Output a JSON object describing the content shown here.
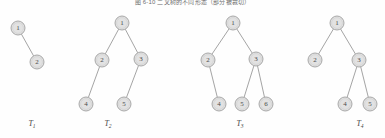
{
  "figure": {
    "caption": "图 6-10    二叉树的不同形态（部分被裁切）",
    "background_color": "#fefefe",
    "node_fill": "#e2e2e2",
    "node_stroke": "#a0a0a0",
    "edge_color": "#9a9a9a",
    "label_color": "#4a4a4a"
  },
  "trees": [
    {
      "name": "T1",
      "label": "T",
      "label_sub": "1",
      "label_x": 32,
      "label_y": 126,
      "nodes": [
        {
          "id": "t1n1",
          "value": "1",
          "x": 18,
          "y": 28,
          "r": 7
        },
        {
          "id": "t1n2",
          "value": "2",
          "x": 37,
          "y": 62,
          "r": 7
        }
      ],
      "edges": [
        {
          "from": "t1n1",
          "to": "t1n2"
        }
      ]
    },
    {
      "name": "T2",
      "label": "T",
      "label_sub": "2",
      "label_x": 108,
      "label_y": 126,
      "nodes": [
        {
          "id": "t2n1",
          "value": "1",
          "x": 122,
          "y": 23,
          "r": 7
        },
        {
          "id": "t2n2",
          "value": "2",
          "x": 102,
          "y": 60,
          "r": 7
        },
        {
          "id": "t2n3",
          "value": "3",
          "x": 141,
          "y": 59,
          "r": 7
        },
        {
          "id": "t2n4",
          "value": "4",
          "x": 86,
          "y": 104,
          "r": 7
        },
        {
          "id": "t2n5",
          "value": "5",
          "x": 124,
          "y": 104,
          "r": 7
        }
      ],
      "edges": [
        {
          "from": "t2n1",
          "to": "t2n2"
        },
        {
          "from": "t2n1",
          "to": "t2n3"
        },
        {
          "from": "t2n2",
          "to": "t2n4"
        },
        {
          "from": "t2n3",
          "to": "t2n5"
        }
      ]
    },
    {
      "name": "T3",
      "label": "T",
      "label_sub": "3",
      "label_x": 240,
      "label_y": 126,
      "nodes": [
        {
          "id": "t3n1",
          "value": "1",
          "x": 233,
          "y": 23,
          "r": 7
        },
        {
          "id": "t3n2",
          "value": "2",
          "x": 208,
          "y": 60,
          "r": 7
        },
        {
          "id": "t3n3",
          "value": "3",
          "x": 256,
          "y": 59,
          "r": 7
        },
        {
          "id": "t3n4",
          "value": "4",
          "x": 219,
          "y": 104,
          "r": 7
        },
        {
          "id": "t3n5",
          "value": "5",
          "x": 242,
          "y": 104,
          "r": 7
        },
        {
          "id": "t3n6",
          "value": "6",
          "x": 266,
          "y": 104,
          "r": 7
        }
      ],
      "edges": [
        {
          "from": "t3n1",
          "to": "t3n2"
        },
        {
          "from": "t3n1",
          "to": "t3n3"
        },
        {
          "from": "t3n2",
          "to": "t3n4"
        },
        {
          "from": "t3n3",
          "to": "t3n5"
        },
        {
          "from": "t3n3",
          "to": "t3n6"
        }
      ]
    },
    {
      "name": "T4",
      "label": "T",
      "label_sub": "4",
      "label_x": 360,
      "label_y": 126,
      "nodes": [
        {
          "id": "t4n1",
          "value": "1",
          "x": 337,
          "y": 23,
          "r": 7
        },
        {
          "id": "t4n2",
          "value": "2",
          "x": 315,
          "y": 60,
          "r": 7
        },
        {
          "id": "t4n3",
          "value": "3",
          "x": 359,
          "y": 60,
          "r": 7
        },
        {
          "id": "t4n4",
          "value": "4",
          "x": 345,
          "y": 104,
          "r": 7
        },
        {
          "id": "t4n5",
          "value": "5",
          "x": 370,
          "y": 104,
          "r": 7
        }
      ],
      "edges": [
        {
          "from": "t4n1",
          "to": "t4n2"
        },
        {
          "from": "t4n1",
          "to": "t4n3"
        },
        {
          "from": "t4n3",
          "to": "t4n4"
        },
        {
          "from": "t4n3",
          "to": "t4n5"
        }
      ]
    }
  ]
}
